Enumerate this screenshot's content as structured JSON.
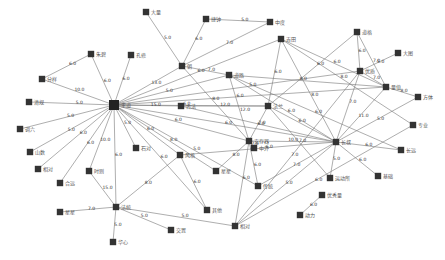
{
  "graph": {
    "type": "network",
    "node_color": "#333333",
    "edge_color": "#777777",
    "nodes": [
      {
        "id": "hub",
        "label": "王道",
        "x": 114,
        "y": 105,
        "r": 5
      },
      {
        "id": "n1",
        "label": "朱碧",
        "x": 91,
        "y": 54
      },
      {
        "id": "n2",
        "label": "孔修",
        "x": 131,
        "y": 55
      },
      {
        "id": "n3",
        "label": "分样",
        "x": 42,
        "y": 79
      },
      {
        "id": "n4",
        "label": "清规",
        "x": 29,
        "y": 102
      },
      {
        "id": "n5",
        "label": "调六",
        "x": 20,
        "y": 129
      },
      {
        "id": "n6",
        "label": "山数",
        "x": 30,
        "y": 152
      },
      {
        "id": "n7",
        "label": "相对",
        "x": 38,
        "y": 169
      },
      {
        "id": "n8",
        "label": "合远",
        "x": 60,
        "y": 183
      },
      {
        "id": "n9",
        "label": "时则",
        "x": 89,
        "y": 171
      },
      {
        "id": "n10",
        "label": "石对",
        "x": 136,
        "y": 148
      },
      {
        "id": "n11",
        "label": "法统",
        "x": 116,
        "y": 207
      },
      {
        "id": "n12",
        "label": "星星",
        "x": 60,
        "y": 212
      },
      {
        "id": "n13",
        "label": "华心",
        "x": 113,
        "y": 242
      },
      {
        "id": "n14",
        "label": "交置",
        "x": 171,
        "y": 230
      },
      {
        "id": "n15",
        "label": "大量",
        "x": 146,
        "y": 12
      },
      {
        "id": "n16",
        "label": "捷钟",
        "x": 206,
        "y": 19
      },
      {
        "id": "n17",
        "label": "中度",
        "x": 270,
        "y": 22
      },
      {
        "id": "n18",
        "label": "朝",
        "x": 182,
        "y": 66
      },
      {
        "id": "n19",
        "label": "道路",
        "x": 229,
        "y": 75
      },
      {
        "id": "n20",
        "label": "吉田",
        "x": 281,
        "y": 39
      },
      {
        "id": "n21",
        "label": "古法",
        "x": 181,
        "y": 106
      },
      {
        "id": "n22",
        "label": "法兰",
        "x": 268,
        "y": 106
      },
      {
        "id": "n23",
        "label": "风格",
        "x": 180,
        "y": 155
      },
      {
        "id": "n24",
        "label": "星星",
        "x": 216,
        "y": 171
      },
      {
        "id": "n25",
        "label": "传统",
        "x": 258,
        "y": 186
      },
      {
        "id": "n26",
        "label": "其他",
        "x": 207,
        "y": 210
      },
      {
        "id": "n27",
        "label": "相对",
        "x": 235,
        "y": 226
      },
      {
        "id": "n28",
        "label": "安存器",
        "x": 249,
        "y": 141
      },
      {
        "id": "n29",
        "label": "长叔",
        "x": 336,
        "y": 142
      },
      {
        "id": "n30",
        "label": "道格",
        "x": 357,
        "y": 32
      },
      {
        "id": "n31",
        "label": "优质",
        "x": 360,
        "y": 71
      },
      {
        "id": "n32",
        "label": "大图",
        "x": 398,
        "y": 53
      },
      {
        "id": "n33",
        "label": "量值",
        "x": 386,
        "y": 87
      },
      {
        "id": "n34",
        "label": "方体",
        "x": 418,
        "y": 97
      },
      {
        "id": "n35",
        "label": "专业",
        "x": 413,
        "y": 125
      },
      {
        "id": "n36",
        "label": "长远",
        "x": 401,
        "y": 150
      },
      {
        "id": "n37",
        "label": "基础",
        "x": 378,
        "y": 176
      },
      {
        "id": "n38",
        "label": "运动所",
        "x": 330,
        "y": 178
      },
      {
        "id": "n39",
        "label": "优秀量",
        "x": 322,
        "y": 195
      },
      {
        "id": "n40",
        "label": "动力",
        "x": 300,
        "y": 215
      },
      {
        "id": "n41",
        "label": "中外",
        "x": 254,
        "y": 148
      }
    ],
    "edges": [
      {
        "s": "hub",
        "t": "n1",
        "w": "6.0"
      },
      {
        "s": "hub",
        "t": "n2",
        "w": "6.0"
      },
      {
        "s": "hub",
        "t": "n3",
        "w": "10.0"
      },
      {
        "s": "hub",
        "t": "n4",
        "w": "5.0"
      },
      {
        "s": "hub",
        "t": "n5",
        "w": "5.0"
      },
      {
        "s": "hub",
        "t": "n6",
        "w": "5.0"
      },
      {
        "s": "hub",
        "t": "n7",
        "w": "6.0"
      },
      {
        "s": "hub",
        "t": "n8",
        "w": "6.0"
      },
      {
        "s": "hub",
        "t": "n9",
        "w": "10.0"
      },
      {
        "s": "hub",
        "t": "n10",
        "w": "5.0"
      },
      {
        "s": "hub",
        "t": "n11",
        "w": "6.0"
      },
      {
        "s": "hub",
        "t": "n18",
        "w": "13.0"
      },
      {
        "s": "hub",
        "t": "n19",
        "w": "5.0"
      },
      {
        "s": "hub",
        "t": "n20",
        "w": "6.0"
      },
      {
        "s": "hub",
        "t": "n21",
        "w": "15.0"
      },
      {
        "s": "hub",
        "t": "n22",
        "w": "6.0"
      },
      {
        "s": "hub",
        "t": "n23",
        "w": "6.0"
      },
      {
        "s": "hub",
        "t": "n24",
        "w": "8.0"
      },
      {
        "s": "hub",
        "t": "n28",
        "w": "6.0"
      },
      {
        "s": "hub",
        "t": "n29",
        "w": "6.0"
      },
      {
        "s": "hub",
        "t": "n31",
        "w": "5.0"
      },
      {
        "s": "hub",
        "t": "n33",
        "w": "6.0"
      },
      {
        "s": "hub",
        "t": "n26",
        "w": "6.0"
      },
      {
        "s": "hub",
        "t": "n25",
        "w": "5.0"
      },
      {
        "s": "n1",
        "t": "n3",
        "w": "6.0"
      },
      {
        "s": "n11",
        "t": "n12",
        "w": "7.0"
      },
      {
        "s": "n11",
        "t": "n13",
        "w": "5.0"
      },
      {
        "s": "n11",
        "t": "n14",
        "w": "5.0"
      },
      {
        "s": "n11",
        "t": "n9",
        "w": "15.0"
      },
      {
        "s": "n11",
        "t": "n27",
        "w": "5.0"
      },
      {
        "s": "n11",
        "t": "n23",
        "w": "8.0"
      },
      {
        "s": "n15",
        "t": "n18",
        "w": "5.0"
      },
      {
        "s": "n16",
        "t": "n17",
        "w": "5.0"
      },
      {
        "s": "n16",
        "t": "n18",
        "w": "6.0"
      },
      {
        "s": "n17",
        "t": "n18",
        "w": "7.0"
      },
      {
        "s": "n18",
        "t": "n19",
        "w": "7.0"
      },
      {
        "s": "n18",
        "t": "n28",
        "w": "8.0"
      },
      {
        "s": "n20",
        "t": "n22",
        "w": "6.0"
      },
      {
        "s": "n20",
        "t": "n29",
        "w": "8.0"
      },
      {
        "s": "n20",
        "t": "n35",
        "w": "8.0"
      },
      {
        "s": "n20",
        "t": "n33",
        "w": "6.0"
      },
      {
        "s": "n19",
        "t": "n28",
        "w": "12.0"
      },
      {
        "s": "n19",
        "t": "n33",
        "w": "8.0"
      },
      {
        "s": "n19",
        "t": "n36",
        "w": "6.0"
      },
      {
        "s": "n19",
        "t": "n29",
        "w": "6.0"
      },
      {
        "s": "n21",
        "t": "n22",
        "w": "12.0"
      },
      {
        "s": "n21",
        "t": "n29",
        "w": "7.0"
      },
      {
        "s": "n22",
        "t": "n28",
        "w": "6.0"
      },
      {
        "s": "n22",
        "t": "n29",
        "w": "6.0"
      },
      {
        "s": "n22",
        "t": "n38",
        "w": "7.0"
      },
      {
        "s": "n22",
        "t": "n30",
        "w": "6.0"
      },
      {
        "s": "n28",
        "t": "n29",
        "w": "10.0"
      },
      {
        "s": "n28",
        "t": "n24",
        "w": "8.0"
      },
      {
        "s": "n28",
        "t": "n25",
        "w": "6.0"
      },
      {
        "s": "n28",
        "t": "n27",
        "w": "6.0"
      },
      {
        "s": "n28",
        "t": "n41",
        "w": "7.0"
      },
      {
        "s": "n29",
        "t": "n37",
        "w": "6.0"
      },
      {
        "s": "n29",
        "t": "n36",
        "w": "6.0"
      },
      {
        "s": "n29",
        "t": "n38",
        "w": "5.0"
      },
      {
        "s": "n29",
        "t": "n31",
        "w": "7.0"
      },
      {
        "s": "n29",
        "t": "n33",
        "w": "11.0"
      },
      {
        "s": "n29",
        "t": "n27",
        "w": "5.0"
      },
      {
        "s": "n29",
        "t": "n25",
        "w": "7.0"
      },
      {
        "s": "n29",
        "t": "n23",
        "w": "6.0"
      },
      {
        "s": "n30",
        "t": "n31",
        "w": "6.0"
      },
      {
        "s": "n30",
        "t": "n33",
        "w": "7.0"
      },
      {
        "s": "n31",
        "t": "n32",
        "w": "5.0"
      },
      {
        "s": "n31",
        "t": "n33",
        "w": "7.0"
      },
      {
        "s": "n31",
        "t": "n27",
        "w": "7.0"
      },
      {
        "s": "n33",
        "t": "n34",
        "w": "8.0"
      },
      {
        "s": "n34",
        "t": "n29",
        "w": "5.0"
      },
      {
        "s": "n35",
        "t": "n27",
        "w": "6.0"
      },
      {
        "s": "n40",
        "t": "n39",
        "w": "6.0"
      },
      {
        "s": "n26",
        "t": "n23",
        "w": "6.0"
      }
    ]
  }
}
